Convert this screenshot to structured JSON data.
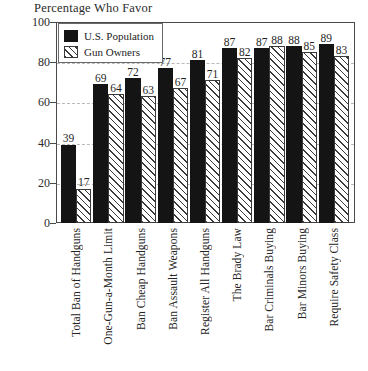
{
  "chart_data": {
    "type": "bar",
    "title": "Percentage Who Favor",
    "xlabel": "",
    "ylabel": "",
    "ylim": [
      0,
      100
    ],
    "yticks": [
      0,
      20,
      40,
      60,
      80,
      100
    ],
    "grid": true,
    "legend_position": "top-left",
    "categories": [
      "Total Ban of Handguns",
      "One-Gun-a-Month Limit",
      "Ban Cheap Handguns",
      "Ban Assault Weapons",
      "Register All Handguns",
      "The Brady Law",
      "Bar Criminals Buying",
      "Bar Minors Buying",
      "Require Safety Class"
    ],
    "series": [
      {
        "name": "U.S. Population",
        "fill": "solid-black",
        "color": "#141414",
        "values": [
          39,
          69,
          72,
          77,
          81,
          87,
          87,
          88,
          89
        ]
      },
      {
        "name": "Gun Owners",
        "fill": "diagonal-hatch",
        "color": "#3a3a3a",
        "values": [
          17,
          64,
          63,
          67,
          71,
          82,
          88,
          85,
          83
        ]
      }
    ]
  },
  "legend": {
    "entries": [
      {
        "label": "U.S. Population"
      },
      {
        "label": "Gun Owners"
      }
    ]
  }
}
